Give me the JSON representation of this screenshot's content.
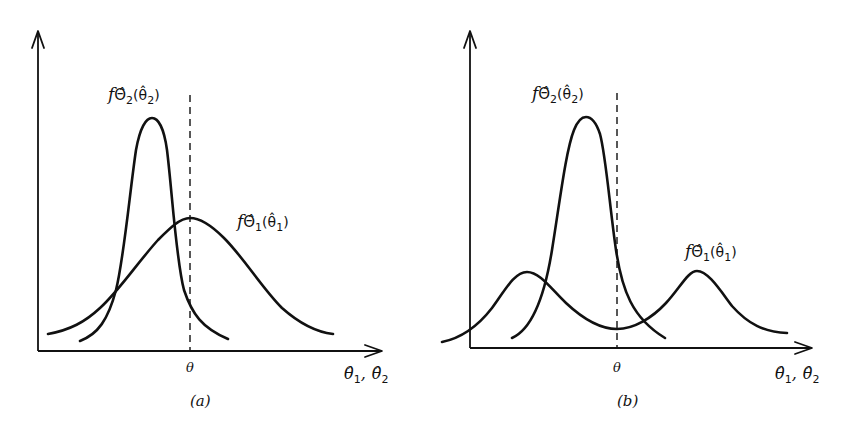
{
  "panels": [
    {
      "id": "a",
      "caption": "(a)",
      "true_value_label": "θ",
      "x_axis_label": {
        "first": "θ̂",
        "first_sub": "1",
        "sep": ",",
        "second": "θ̂",
        "second_sub": "2"
      },
      "curves": [
        {
          "name": "f_Theta2_hat",
          "label": {
            "f": "f",
            "cap": "Θ̂",
            "sub": "2",
            "arg": "(θ̂",
            "arg_sub": "2",
            "close": ")"
          },
          "description": "narrow, tall, peak left of θ (biased, low variance)"
        },
        {
          "name": "f_Theta1_hat",
          "label": {
            "f": "f",
            "cap": "Θ̂",
            "sub": "1",
            "arg": "(θ̂",
            "arg_sub": "1",
            "close": ")"
          },
          "description": "wide, low, centered at θ (unbiased, high variance)"
        }
      ]
    },
    {
      "id": "b",
      "caption": "(b)",
      "true_value_label": "θ",
      "x_axis_label": {
        "first": "θ̂",
        "first_sub": "1",
        "sep": ",",
        "second": "θ̂",
        "second_sub": "2"
      },
      "curves": [
        {
          "name": "f_Theta2_hat",
          "label": {
            "f": "f",
            "cap": "Θ̂",
            "sub": "2",
            "arg": "(θ̂",
            "arg_sub": "2",
            "close": ")"
          },
          "description": "narrow, tall, peak slightly left of θ"
        },
        {
          "name": "f_Theta1_hat",
          "label": {
            "f": "f",
            "cap": "Θ̂",
            "sub": "1",
            "arg": "(θ̂",
            "arg_sub": "1",
            "close": ")"
          },
          "description": "bimodal, symmetric about θ (unbiased, high variance)"
        }
      ]
    }
  ],
  "colors": {
    "ink": "#111111",
    "background": "#ffffff"
  }
}
